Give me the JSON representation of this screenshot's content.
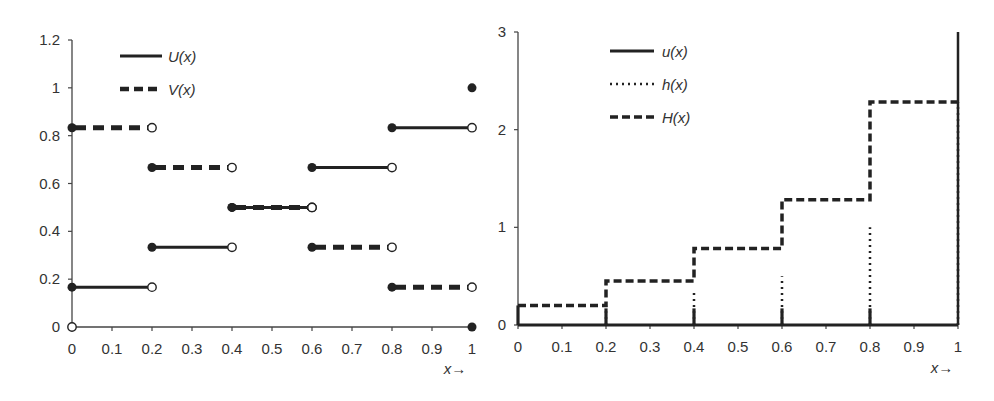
{
  "chart_data": [
    {
      "type": "line",
      "subtype": "step",
      "title": "",
      "xlabel": "x→",
      "ylabel": "",
      "xlim": [
        0,
        1
      ],
      "ylim": [
        0,
        1.2
      ],
      "x_ticks": [
        "0",
        "0.1",
        "0.2",
        "0.3",
        "0.4",
        "0.5",
        "0.6",
        "0.7",
        "0.8",
        "0.9",
        "1"
      ],
      "y_ticks": [
        "0",
        "0.2",
        "0.4",
        "0.6",
        "0.8",
        "1",
        "1.2"
      ],
      "legend": [
        "U(x)",
        "V(x)"
      ],
      "legend_position": "upper-left",
      "grid": false,
      "series": [
        {
          "name": "U(x)",
          "style": "solid",
          "segments": [
            {
              "x0": 0.0,
              "x1": 0.2,
              "y": 0.1667
            },
            {
              "x0": 0.2,
              "x1": 0.4,
              "y": 0.3333
            },
            {
              "x0": 0.4,
              "x1": 0.6,
              "y": 0.5
            },
            {
              "x0": 0.6,
              "x1": 0.8,
              "y": 0.6667
            },
            {
              "x0": 0.8,
              "x1": 1.0,
              "y": 0.8333
            }
          ],
          "points": [
            {
              "x": 0,
              "y": 0,
              "marker": "open"
            },
            {
              "x": 1,
              "y": 1,
              "marker": "filled"
            }
          ]
        },
        {
          "name": "V(x)",
          "style": "dashed",
          "segments": [
            {
              "x0": 0.0,
              "x1": 0.2,
              "y": 0.8333
            },
            {
              "x0": 0.2,
              "x1": 0.4,
              "y": 0.6667
            },
            {
              "x0": 0.4,
              "x1": 0.6,
              "y": 0.5
            },
            {
              "x0": 0.6,
              "x1": 0.8,
              "y": 0.3333
            },
            {
              "x0": 0.8,
              "x1": 1.0,
              "y": 0.1667
            }
          ],
          "points": [
            {
              "x": 1,
              "y": 0,
              "marker": "filled"
            }
          ]
        }
      ]
    },
    {
      "type": "line",
      "subtype": "step",
      "title": "",
      "xlabel": "x→",
      "ylabel": "",
      "xlim": [
        0,
        1
      ],
      "ylim": [
        0,
        3
      ],
      "x_ticks": [
        "0",
        "0.1",
        "0.2",
        "0.3",
        "0.4",
        "0.5",
        "0.6",
        "0.7",
        "0.8",
        "0.9",
        "1"
      ],
      "y_ticks": [
        "0",
        "1",
        "2",
        "3"
      ],
      "legend": [
        "u(x)",
        "h(x)",
        "H(x)"
      ],
      "legend_position": "upper-left",
      "grid": false,
      "series": [
        {
          "name": "u(x)",
          "style": "solid",
          "description": "zero baseline with short spikes at 0, 0.2, 0.4, 0.6, 0.8 and tall spike at 1",
          "spikes": [
            {
              "x": 0.0,
              "y": 0.2
            },
            {
              "x": 0.2,
              "y": 0.17
            },
            {
              "x": 0.4,
              "y": 0.17
            },
            {
              "x": 0.6,
              "y": 0.17
            },
            {
              "x": 0.8,
              "y": 0.17
            },
            {
              "x": 1.0,
              "y": 3.0
            }
          ]
        },
        {
          "name": "h(x)",
          "style": "dotted",
          "spikes": [
            {
              "x": 0.2,
              "y": 0.2
            },
            {
              "x": 0.4,
              "y": 0.33
            },
            {
              "x": 0.6,
              "y": 0.5
            },
            {
              "x": 0.8,
              "y": 1.0
            },
            {
              "x": 1.0,
              "y": 2.28
            }
          ]
        },
        {
          "name": "H(x)",
          "style": "dashed",
          "segments": [
            {
              "x0": 0.0,
              "x1": 0.2,
              "y": 0.2
            },
            {
              "x0": 0.2,
              "x1": 0.4,
              "y": 0.45
            },
            {
              "x0": 0.4,
              "x1": 0.6,
              "y": 0.783
            },
            {
              "x0": 0.6,
              "x1": 0.8,
              "y": 1.283
            },
            {
              "x0": 0.8,
              "x1": 1.0,
              "y": 2.283
            }
          ]
        }
      ]
    }
  ],
  "left_chart": {
    "legend": {
      "u": "U(x)",
      "v": "V(x)"
    },
    "xlabel": "x→",
    "x_ticks": [
      "0",
      "0.1",
      "0.2",
      "0.3",
      "0.4",
      "0.5",
      "0.6",
      "0.7",
      "0.8",
      "0.9",
      "1"
    ],
    "y_ticks": [
      "0",
      "0.2",
      "0.4",
      "0.6",
      "0.8",
      "1",
      "1.2"
    ]
  },
  "right_chart": {
    "legend": {
      "u": "u(x)",
      "h": "h(x)",
      "H": "H(x)"
    },
    "xlabel": "x→",
    "x_ticks": [
      "0",
      "0.1",
      "0.2",
      "0.3",
      "0.4",
      "0.5",
      "0.6",
      "0.7",
      "0.8",
      "0.9",
      "1"
    ],
    "y_ticks": [
      "0",
      "1",
      "2",
      "3"
    ]
  },
  "colors": {
    "ink": "#222222",
    "text": "#333333",
    "background": "#ffffff"
  }
}
